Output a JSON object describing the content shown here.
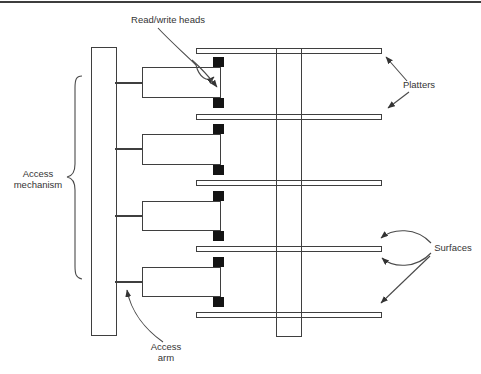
{
  "diagram": {
    "labels": {
      "read_write_heads": "Read/write heads",
      "platters": "Platters",
      "access_mechanism": "Access mechanism",
      "surfaces": "Surfaces",
      "access_arm": "Access arm"
    },
    "colors": {
      "line": "#3f3f3f",
      "head_fill": "#141414",
      "background": "#ffffff"
    },
    "structure": {
      "platter_count": 5,
      "access_arm_count": 4,
      "read_write_head_count": 8
    }
  }
}
